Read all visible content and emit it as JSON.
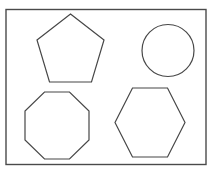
{
  "figure": {
    "canvas_width": 216,
    "canvas_height": 173,
    "background_color": "#ffffff",
    "stroke_color": "#474747",
    "fill_color": "#ffffff",
    "frame": {
      "label": "bounding rectangle frame",
      "x": 6,
      "y": 9.5,
      "width": 200,
      "height": 155,
      "stroke_color": "#4a4a4a",
      "stroke_width": 1.4
    },
    "shapes": [
      {
        "name": "pentagon",
        "label": "Pentagon",
        "sides": 5,
        "position": "top-left",
        "center_x": 70.5,
        "center_y": 49,
        "bbox": {
          "x": 38,
          "y": 14,
          "width": 66,
          "height": 68
        },
        "points": "70.5,14 104,40 91.5,82 49.5,82 37,40",
        "stroke_color": "#474747",
        "fill_color": "#ffffff"
      },
      {
        "name": "circle",
        "label": "Circle",
        "sides": 0,
        "position": "top-right",
        "center_x": 168,
        "center_y": 50.5,
        "radius": 26,
        "bbox": {
          "x": 142,
          "y": 24.5,
          "width": 52,
          "height": 52
        },
        "stroke_color": "#474747",
        "fill_color": "#ffffff"
      },
      {
        "name": "octagon",
        "label": "Octagon",
        "sides": 8,
        "position": "bottom-left",
        "center_x": 57,
        "center_y": 125.5,
        "bbox": {
          "x": 25,
          "y": 92,
          "width": 64,
          "height": 67
        },
        "points": "44.5,92 69.5,92 89,111 89,140 69.5,159 44.5,159 25,140 25,111",
        "stroke_color": "#474747",
        "fill_color": "#ffffff"
      },
      {
        "name": "hexagon",
        "label": "Hexagon",
        "sides": 6,
        "position": "bottom-right",
        "center_x": 150,
        "center_y": 122.5,
        "bbox": {
          "x": 115,
          "y": 88,
          "width": 70,
          "height": 69
        },
        "points": "132.5,88 167.5,88 185,122.5 167.5,157 132.5,157 115,122.5",
        "stroke_color": "#474747",
        "fill_color": "#ffffff"
      }
    ]
  }
}
